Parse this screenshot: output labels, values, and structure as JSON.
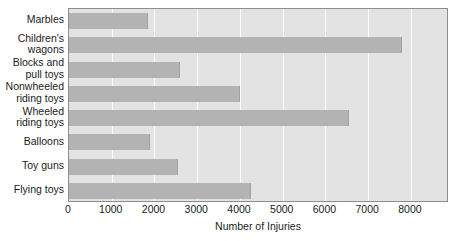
{
  "chart_data": {
    "type": "bar",
    "orientation": "horizontal",
    "title": "",
    "xlabel": "Number of Injuries",
    "ylabel": "",
    "categories": [
      "Marbles",
      "Children's wagons",
      "Blocks and pull toys",
      "Nonwheeled riding toys",
      "Wheeled riding toys",
      "Balloons",
      "Toy guns",
      "Flying toys"
    ],
    "category_lines": [
      [
        "Marbles"
      ],
      [
        "Children's",
        "wagons"
      ],
      [
        "Blocks and",
        "pull toys"
      ],
      [
        "Nonwheeled",
        "riding toys"
      ],
      [
        "Wheeled",
        "riding toys"
      ],
      [
        "Balloons"
      ],
      [
        "Toy guns"
      ],
      [
        "Flying toys"
      ]
    ],
    "values": [
      1850,
      7800,
      2600,
      4000,
      6550,
      1900,
      2550,
      4250
    ],
    "xlim": [
      0,
      8890
    ],
    "xticks": [
      0,
      1000,
      2000,
      3000,
      4000,
      5000,
      6000,
      7000,
      8000
    ],
    "xtick_labels": [
      "0",
      "1000",
      "2000",
      "3000",
      "4000",
      "5000",
      "6000",
      "7000",
      "8000"
    ],
    "grid": "vertical",
    "legend": "none",
    "colors": {
      "bar_fill": "#b3b3b3",
      "plot_background": "#e3e3e3",
      "gridline": "#fbfbfb",
      "axis_border": "#8d8d8d",
      "text": "#1b1b1b"
    }
  }
}
